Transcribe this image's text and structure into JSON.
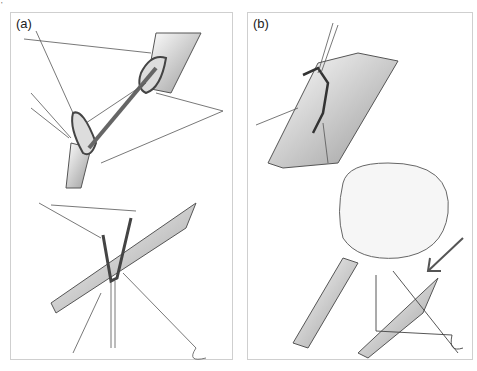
{
  "figure": {
    "panels": [
      {
        "id": "a",
        "label": "(a)",
        "description": "Vessel ends approximated with stay sutures and suture-loop ring; lower view shows end-to-side suturing with needle"
      },
      {
        "id": "b",
        "label": "(b)",
        "description": "Completed anastomosis with interrupted sutures; lower view shows vessel behind bulbous structure with arrow indicating suture site"
      }
    ],
    "colors": {
      "line": "#444444",
      "shade": "#9a9a9a",
      "border": "#cfcfcf",
      "background": "#ffffff"
    }
  }
}
